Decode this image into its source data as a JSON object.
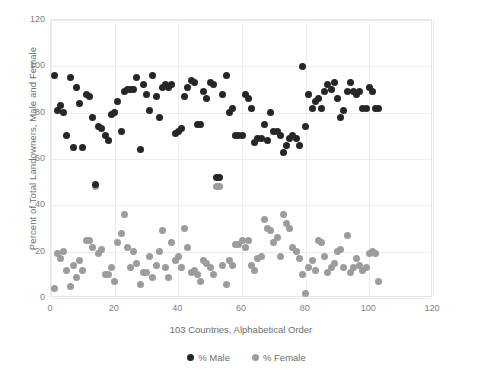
{
  "chart_data": {
    "type": "scatter",
    "title": "",
    "xlabel": "103 Countries, Alphabetical Order",
    "ylabel": "Percent of Total Landowners, Male and Female",
    "xlim": [
      0,
      120
    ],
    "ylim": [
      0,
      120
    ],
    "xticks": [
      0,
      20,
      40,
      60,
      80,
      100,
      120
    ],
    "yticks": [
      0,
      20,
      40,
      60,
      80,
      100,
      120
    ],
    "grid": true,
    "legend_position": "bottom",
    "colors": {
      "male": "#262626",
      "female": "#9c9c9c",
      "gridline": "#ededed",
      "axis_text": "#808080",
      "title_text": "#6e6e6e",
      "background": "#ffffff"
    },
    "series": [
      {
        "name": "% Male",
        "color": "#262626",
        "x": [
          1,
          2,
          3,
          4,
          5,
          6,
          7,
          8,
          9,
          10,
          11,
          12,
          13,
          14,
          15,
          16,
          17,
          18,
          19,
          20,
          21,
          22,
          23,
          24,
          25,
          26,
          27,
          28,
          29,
          30,
          31,
          32,
          33,
          34,
          35,
          36,
          37,
          38,
          39,
          40,
          41,
          42,
          43,
          44,
          45,
          46,
          47,
          48,
          49,
          50,
          51,
          52,
          53,
          54,
          55,
          56,
          57,
          58,
          59,
          60,
          61,
          62,
          63,
          64,
          65,
          66,
          67,
          68,
          69,
          70,
          71,
          72,
          73,
          74,
          75,
          76,
          77,
          78,
          79,
          80,
          81,
          82,
          83,
          84,
          85,
          86,
          87,
          88,
          89,
          90,
          91,
          92,
          93,
          94,
          95,
          96,
          97,
          98,
          99,
          100,
          101,
          102,
          103
        ],
        "y": [
          96,
          81,
          83,
          80,
          70,
          95,
          65,
          91,
          84,
          65,
          88,
          87,
          78,
          49,
          74,
          73,
          70,
          68,
          79,
          80,
          85,
          72,
          89,
          90,
          90,
          90,
          95,
          64,
          92,
          88,
          81,
          96,
          87,
          78,
          91,
          92,
          91,
          92,
          71,
          72,
          73,
          87,
          91,
          94,
          93,
          75,
          75,
          89,
          86,
          93,
          92,
          52,
          52,
          88,
          96,
          80,
          82,
          70,
          70,
          70,
          88,
          86,
          82,
          67,
          69,
          69,
          75,
          68,
          80,
          72,
          72,
          70,
          63,
          66,
          69,
          70,
          69,
          66,
          100,
          74,
          88,
          82,
          85,
          86,
          82,
          89,
          92,
          90,
          93,
          86,
          78,
          81,
          89,
          93,
          89,
          88,
          89,
          82,
          82,
          91,
          89,
          82,
          82
        ]
      },
      {
        "name": "% Female",
        "color": "#9c9c9c",
        "x": [
          1,
          2,
          3,
          4,
          5,
          6,
          7,
          8,
          9,
          10,
          11,
          12,
          13,
          14,
          15,
          16,
          17,
          18,
          19,
          20,
          21,
          22,
          23,
          24,
          25,
          26,
          27,
          28,
          29,
          30,
          31,
          32,
          33,
          34,
          35,
          36,
          37,
          38,
          39,
          40,
          41,
          42,
          43,
          44,
          45,
          46,
          47,
          48,
          49,
          50,
          51,
          52,
          53,
          54,
          55,
          56,
          57,
          58,
          59,
          60,
          61,
          62,
          63,
          64,
          65,
          66,
          67,
          68,
          69,
          70,
          71,
          72,
          73,
          74,
          75,
          76,
          77,
          78,
          79,
          80,
          81,
          82,
          83,
          84,
          85,
          86,
          87,
          88,
          89,
          90,
          91,
          92,
          93,
          94,
          95,
          96,
          97,
          98,
          99,
          100,
          101,
          102,
          103
        ],
        "y": [
          4,
          19,
          17,
          20,
          12,
          5,
          14,
          9,
          16,
          12,
          25,
          25,
          22,
          48,
          19,
          21,
          10,
          10,
          13,
          7,
          24,
          28,
          36,
          22,
          13,
          20,
          15,
          6,
          11,
          11,
          18,
          9,
          14,
          20,
          29,
          13,
          9,
          24,
          16,
          18,
          13,
          30,
          22,
          11,
          12,
          10,
          7,
          16,
          15,
          13,
          10,
          48,
          48,
          14,
          6,
          16,
          14,
          23,
          23,
          25,
          22,
          25,
          14,
          12,
          17,
          18,
          34,
          30,
          29,
          24,
          26,
          18,
          36,
          32,
          30,
          22,
          20,
          17,
          10,
          2,
          13,
          16,
          12,
          25,
          24,
          18,
          11,
          13,
          15,
          20,
          21,
          13,
          27,
          11,
          13,
          17,
          14,
          12,
          13,
          19,
          20,
          19,
          7
        ]
      }
    ]
  },
  "legend": {
    "items": [
      {
        "label": "% Male",
        "color": "#262626"
      },
      {
        "label": "% Female",
        "color": "#9c9c9c"
      }
    ]
  }
}
